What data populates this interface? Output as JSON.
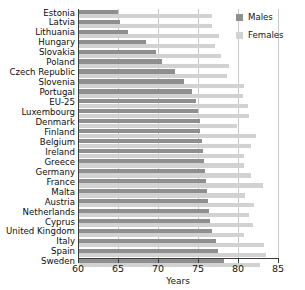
{
  "chart_data": {
    "type": "bar",
    "orientation": "horizontal",
    "title": "",
    "xlabel": "Years",
    "ylabel": "",
    "xlim": [
      60,
      85
    ],
    "xticks": [
      60,
      65,
      70,
      75,
      80,
      85
    ],
    "grid": true,
    "legend_position": "top-right",
    "categories": [
      "Estonia",
      "Latvia",
      "Lithuania",
      "Hungary",
      "Slovakia",
      "Poland",
      "Czech Republic",
      "Slovenia",
      "Portugal",
      "EU-25",
      "Luxembourg",
      "Denmark",
      "Finland",
      "Belgium",
      "Ireland",
      "Greece",
      "Germany",
      "France",
      "Malta",
      "Austria",
      "Netherlands",
      "Cyprus",
      "United Kingdom",
      "Italy",
      "Spain",
      "Sweden"
    ],
    "series": [
      {
        "name": "Males",
        "color": "#8f8f8f",
        "values": [
          65.0,
          65.3,
          66.2,
          68.5,
          69.8,
          70.5,
          72.1,
          73.3,
          74.2,
          74.8,
          75.0,
          75.2,
          75.3,
          75.5,
          75.6,
          75.7,
          75.9,
          76.0,
          76.1,
          76.2,
          76.4,
          76.5,
          76.7,
          77.3,
          77.5,
          78.3
        ]
      },
      {
        "name": "Females",
        "color": "#d2d2d2",
        "values": [
          76.8,
          76.8,
          77.6,
          77.1,
          77.9,
          78.9,
          78.6,
          80.7,
          80.6,
          81.2,
          81.4,
          79.9,
          82.3,
          81.6,
          80.7,
          80.7,
          81.6,
          83.1,
          80.9,
          82.0,
          81.4,
          81.9,
          80.7,
          83.2,
          83.5,
          82.7
        ]
      }
    ]
  },
  "legend": {
    "males_label": "Males",
    "females_label": "Females"
  },
  "axis": {
    "x_label": "Years",
    "tick_labels": [
      "60",
      "65",
      "70",
      "75",
      "80",
      "85"
    ]
  }
}
